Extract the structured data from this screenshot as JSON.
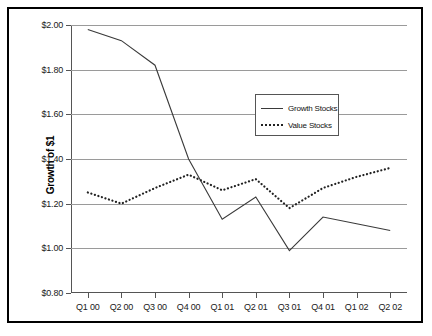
{
  "chart_data": {
    "type": "line",
    "title": "",
    "xlabel": "",
    "ylabel": "Growth of $1",
    "categories": [
      "Q1 00",
      "Q2 00",
      "Q3 00",
      "Q4 00",
      "Q1 01",
      "Q2 01",
      "Q3 01",
      "Q4 01",
      "Q1 02",
      "Q2 02"
    ],
    "ylim": [
      0.8,
      2.0
    ],
    "ytick_values": [
      2.0,
      1.8,
      1.6,
      1.4,
      1.2,
      1.0,
      0.8
    ],
    "ytick_labels": [
      "$2.00",
      "$1.80",
      "$1.60",
      "$1.40",
      "$1.20",
      "$1.00",
      "$0.80"
    ],
    "grid": "horizontal",
    "legend_position": "upper-right-inside",
    "series": [
      {
        "name": "Growth Stocks",
        "style": "solid",
        "color": "#3a3a3a",
        "values": [
          1.98,
          1.93,
          1.82,
          1.4,
          1.13,
          1.23,
          0.99,
          1.14,
          1.11,
          1.08
        ]
      },
      {
        "name": "Value Stocks",
        "style": "dotted",
        "color": "#222222",
        "values": [
          1.25,
          1.2,
          1.27,
          1.33,
          1.26,
          1.31,
          1.18,
          1.27,
          1.32,
          1.36
        ]
      }
    ]
  },
  "legend": {
    "items": [
      {
        "label": "Growth Stocks"
      },
      {
        "label": "Value Stocks"
      }
    ]
  }
}
